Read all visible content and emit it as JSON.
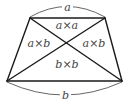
{
  "diagram": {
    "type": "trapezoid-with-diagonals",
    "colors": {
      "edge": "#1a1a1a",
      "arc": "#555555",
      "label": "#444444",
      "background": "#ffffff"
    },
    "edges": {
      "top_label": "a",
      "bottom_label": "b"
    },
    "regions": {
      "top": "a×a",
      "left": "a×b",
      "right": "a×b",
      "bottom": "b×b"
    }
  }
}
